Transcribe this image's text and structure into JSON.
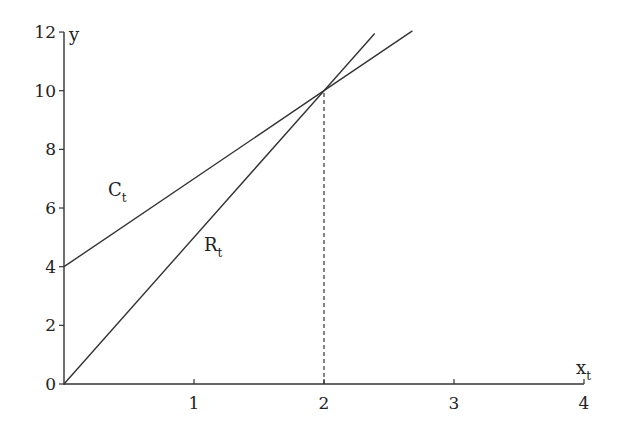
{
  "chart_data": {
    "type": "line",
    "title": "",
    "xlabel": "x_t",
    "ylabel": "y",
    "xlim": [
      0,
      4
    ],
    "ylim": [
      0,
      12
    ],
    "x_ticks": [
      "1",
      "2",
      "3",
      "4"
    ],
    "y_ticks": [
      "0",
      "2",
      "4",
      "6",
      "8",
      "10",
      "12"
    ],
    "grid": false,
    "legend": "none (inline labels)",
    "series": [
      {
        "name": "C_t",
        "label_main": "C",
        "label_sub": "t",
        "x": [
          0,
          2,
          2.68
        ],
        "values": [
          4,
          10,
          12.04
        ],
        "equation": "y = 4 + 3x"
      },
      {
        "name": "R_t",
        "label_main": "R",
        "label_sub": "t",
        "x": [
          0,
          2,
          2.39
        ],
        "values": [
          0,
          10,
          11.95
        ],
        "equation": "y = 5x"
      }
    ],
    "annotations": [
      {
        "type": "dashed-vertical-line",
        "x": 2,
        "from_y": 0,
        "to_y": 10,
        "note": "intersection at (2, 10)"
      }
    ]
  },
  "axes": {
    "x_label_main": "x",
    "x_label_sub": "t",
    "y_label": "y"
  }
}
